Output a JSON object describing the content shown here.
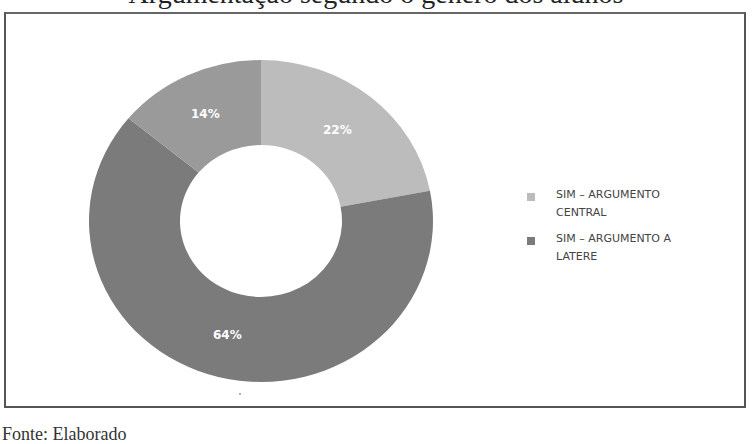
{
  "page": {
    "top_caption_partial": "Argumentação segundo o gênero dos alunos",
    "bottom_caption_partial": "Fonte: Elaborado"
  },
  "chart_data": {
    "type": "pie",
    "subtype": "donut",
    "title": "",
    "slices": [
      {
        "label": "SIM – ARGUMENTO CENTRAL",
        "value": 22,
        "display": "22%",
        "color": "#bcbcbc"
      },
      {
        "label": "SIM – ARGUMENTO A LATERE",
        "value": 64,
        "display": "64%",
        "color": "#7b7b7b"
      },
      {
        "label": "",
        "value": 14,
        "display": "14%",
        "color": "#9a9a9a"
      }
    ],
    "start_angle_deg": 0,
    "direction": "clockwise",
    "legend": {
      "position": "right",
      "entries": [
        {
          "label": "SIM – ARGUMENTO CENTRAL",
          "color": "#bcbcbc"
        },
        {
          "label": "SIM – ARGUMENTO A LATERE",
          "color": "#7b7b7b"
        }
      ]
    }
  },
  "labels": {
    "slice_central": "22%",
    "slice_latere": "64%",
    "slice_other": "14%"
  },
  "legend": {
    "items": [
      {
        "label": "SIM – ARGUMENTO CENTRAL",
        "color": "#bcbcbc"
      },
      {
        "label": "SIM – ARGUMENTO A LATERE",
        "color": "#7b7b7b"
      }
    ]
  }
}
